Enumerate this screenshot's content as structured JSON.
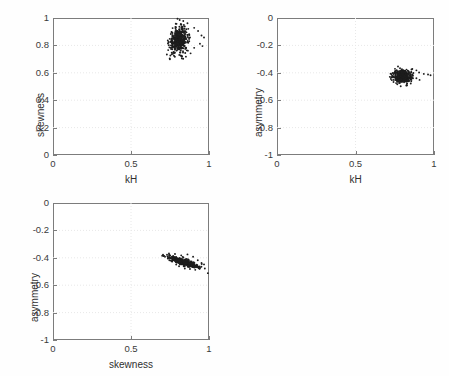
{
  "figure": {
    "background_color": "#ffffff",
    "axis_color": "#7c7c7c",
    "grid_color": "#e8e8e8",
    "marker_color": "#1d1d1d"
  },
  "chart_data": [
    {
      "type": "scatter",
      "title": "",
      "panel_id": "panel-skewness-vs-kh",
      "xlabel": "kH",
      "ylabel": "skewness",
      "xlim": [
        0,
        1
      ],
      "ylim": [
        0,
        1
      ],
      "xticks": [
        0,
        0.5,
        1
      ],
      "xticklabels": [
        "0",
        "0.5",
        "1"
      ],
      "yticks": [
        0,
        0.2,
        0.4,
        0.6,
        0.8,
        1
      ],
      "yticklabels": [
        "0",
        "0.2",
        "0.4",
        "0.6",
        "0.8",
        "1"
      ],
      "grid": true,
      "legend": null,
      "n_points": 430,
      "cluster": {
        "x_center": 0.808,
        "y_center": 0.838,
        "x_spread": 0.03,
        "y_spread": 0.045,
        "correlation": 0.12
      },
      "outliers": [
        {
          "x": 0.798,
          "y": 0.995
        },
        {
          "x": 0.812,
          "y": 0.985
        },
        {
          "x": 0.835,
          "y": 0.978
        },
        {
          "x": 0.862,
          "y": 0.962
        },
        {
          "x": 0.787,
          "y": 0.958
        },
        {
          "x": 0.905,
          "y": 0.928
        },
        {
          "x": 0.93,
          "y": 0.905
        },
        {
          "x": 0.952,
          "y": 0.872
        },
        {
          "x": 0.968,
          "y": 0.858
        },
        {
          "x": 0.942,
          "y": 0.812
        },
        {
          "x": 0.958,
          "y": 0.795
        },
        {
          "x": 0.905,
          "y": 0.782
        },
        {
          "x": 0.882,
          "y": 0.742
        },
        {
          "x": 0.852,
          "y": 0.718
        },
        {
          "x": 0.826,
          "y": 0.705
        },
        {
          "x": 0.762,
          "y": 0.735
        }
      ]
    },
    {
      "type": "scatter",
      "title": "",
      "panel_id": "panel-asymmetry-vs-kh",
      "xlabel": "kH",
      "ylabel": "asymmetry",
      "xlim": [
        0,
        1
      ],
      "ylim": [
        -1,
        0
      ],
      "xticks": [
        0,
        0.5,
        1
      ],
      "xticklabels": [
        "0",
        "0.5",
        "1"
      ],
      "yticks": [
        -1,
        -0.8,
        -0.6,
        -0.4,
        -0.2,
        0
      ],
      "yticklabels": [
        "-1",
        "-0.8",
        "-0.6",
        "-0.4",
        "-0.2",
        "0"
      ],
      "grid": true,
      "legend": null,
      "n_points": 430,
      "cluster": {
        "x_center": 0.8,
        "y_center": -0.425,
        "x_spread": 0.028,
        "y_spread": 0.022,
        "correlation": -0.1
      },
      "outliers": [
        {
          "x": 0.862,
          "y": -0.372
        },
        {
          "x": 0.888,
          "y": -0.382
        },
        {
          "x": 0.905,
          "y": -0.398
        },
        {
          "x": 0.935,
          "y": -0.408
        },
        {
          "x": 0.962,
          "y": -0.412
        },
        {
          "x": 0.978,
          "y": -0.418
        },
        {
          "x": 0.852,
          "y": -0.478
        },
        {
          "x": 0.828,
          "y": -0.492
        },
        {
          "x": 0.788,
          "y": -0.498
        },
        {
          "x": 0.908,
          "y": -0.452
        },
        {
          "x": 0.742,
          "y": -0.452
        }
      ]
    },
    {
      "type": "scatter",
      "title": "",
      "panel_id": "panel-asymmetry-vs-skewness",
      "xlabel": "skewness",
      "ylabel": "asymmetry",
      "xlim": [
        0,
        1
      ],
      "ylim": [
        -1,
        0
      ],
      "xticks": [
        0,
        0.5,
        1
      ],
      "xticklabels": [
        "0",
        "0.5",
        "1"
      ],
      "yticks": [
        -1,
        -0.8,
        -0.6,
        -0.4,
        -0.2,
        0
      ],
      "yticklabels": [
        "-1",
        "-0.8",
        "-0.6",
        "-0.4",
        "-0.2",
        "0"
      ],
      "grid": true,
      "legend": null,
      "n_points": 430,
      "cluster": {
        "x_center": 0.838,
        "y_center": -0.432,
        "x_spread": 0.048,
        "y_spread": 0.02,
        "correlation": -0.82
      },
      "outliers": [
        {
          "x": 0.7,
          "y": -0.385
        },
        {
          "x": 0.718,
          "y": -0.392
        },
        {
          "x": 0.745,
          "y": -0.378
        },
        {
          "x": 0.782,
          "y": -0.372
        },
        {
          "x": 0.822,
          "y": -0.382
        },
        {
          "x": 0.862,
          "y": -0.375
        },
        {
          "x": 0.898,
          "y": -0.392
        },
        {
          "x": 0.928,
          "y": -0.418
        },
        {
          "x": 0.952,
          "y": -0.438
        },
        {
          "x": 0.968,
          "y": -0.448
        },
        {
          "x": 0.912,
          "y": -0.488
        },
        {
          "x": 0.878,
          "y": -0.482
        },
        {
          "x": 0.845,
          "y": -0.478
        },
        {
          "x": 0.808,
          "y": -0.462
        }
      ]
    }
  ]
}
